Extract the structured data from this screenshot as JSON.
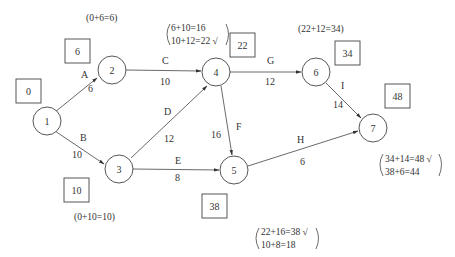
{
  "nodes": [
    {
      "id": "1",
      "label": "1",
      "cx": 47,
      "cy": 121
    },
    {
      "id": "2",
      "label": "2",
      "cx": 112,
      "cy": 70
    },
    {
      "id": "3",
      "label": "3",
      "cx": 119,
      "cy": 169
    },
    {
      "id": "4",
      "label": "4",
      "cx": 216,
      "cy": 72
    },
    {
      "id": "5",
      "label": "5",
      "cx": 234,
      "cy": 170
    },
    {
      "id": "6",
      "label": "6",
      "cx": 316,
      "cy": 72
    },
    {
      "id": "7",
      "label": "7",
      "cx": 373,
      "cy": 128
    }
  ],
  "activities": [
    {
      "name": "A",
      "duration": "6",
      "from": "1",
      "to": "2"
    },
    {
      "name": "B",
      "duration": "10",
      "from": "1",
      "to": "3"
    },
    {
      "name": "C",
      "duration": "10",
      "from": "2",
      "to": "4"
    },
    {
      "name": "D",
      "duration": "12",
      "from": "3",
      "to": "4"
    },
    {
      "name": "E",
      "duration": "8",
      "from": "3",
      "to": "5"
    },
    {
      "name": "F",
      "duration": "16",
      "from": "4",
      "to": "5"
    },
    {
      "name": "G",
      "duration": "12",
      "from": "4",
      "to": "6"
    },
    {
      "name": "H",
      "duration": "6",
      "from": "5",
      "to": "7"
    },
    {
      "name": "I",
      "duration": "14",
      "from": "6",
      "to": "7"
    }
  ],
  "earliest_times": {
    "n1": "0",
    "n2": "6",
    "n3": "10",
    "n4": "22",
    "n5": "38",
    "n6": "34",
    "n7": "48"
  },
  "calculations": {
    "n2": "(0+6=6)",
    "n3": "(0+10=10)",
    "n4": [
      "6+10=16",
      "10+12=22 √"
    ],
    "n5": [
      "22+16=38 √",
      "10+8=18"
    ],
    "n6": "(22+12=34)",
    "n7": [
      "34+14=48 √",
      "38+6=44"
    ]
  }
}
